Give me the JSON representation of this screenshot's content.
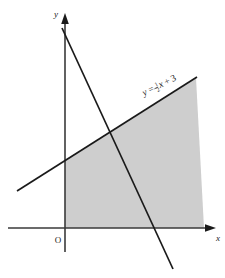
{
  "figure": {
    "name": "linear-inequality-region-graph",
    "background_color": "#ffffff",
    "stroke_color": "#1a1a1a",
    "shade_color": "#cecece"
  },
  "axes": {
    "x_label": "x",
    "y_label": "y",
    "origin_label": "O",
    "x_axis": {
      "y_pixel": 228,
      "x_start": 8,
      "x_end": 216
    },
    "y_axis": {
      "x_pixel": 65,
      "y_start": 14,
      "y_end": 252
    }
  },
  "lines": [
    {
      "id": "boundary-line",
      "equation_label": "y = ½x + 3",
      "equation_parts": {
        "lhs": "y",
        "equals": "=",
        "numerator": "1",
        "denominator": "2",
        "x_term": "x",
        "plus": "+",
        "constant": "3"
      },
      "slope": 0.5,
      "intercept": 3,
      "label_rotation_deg": -26,
      "label_x": 144,
      "label_y": 96,
      "pixel_start": {
        "x": 17,
        "y": 191
      },
      "pixel_end": {
        "x": 197,
        "y": 77
      }
    },
    {
      "id": "steep-descending-line",
      "equation_label": "",
      "pixel_start": {
        "x": 62,
        "y": 28
      },
      "pixel_end": {
        "x": 173,
        "y": 269
      }
    }
  ],
  "shaded_region": {
    "id": "solution-region",
    "fill": "#cecece",
    "vertices": [
      {
        "x": 65,
        "y": 228
      },
      {
        "x": 65,
        "y": 160
      },
      {
        "x": 196,
        "y": 78
      },
      {
        "x": 204,
        "y": 228
      }
    ]
  }
}
